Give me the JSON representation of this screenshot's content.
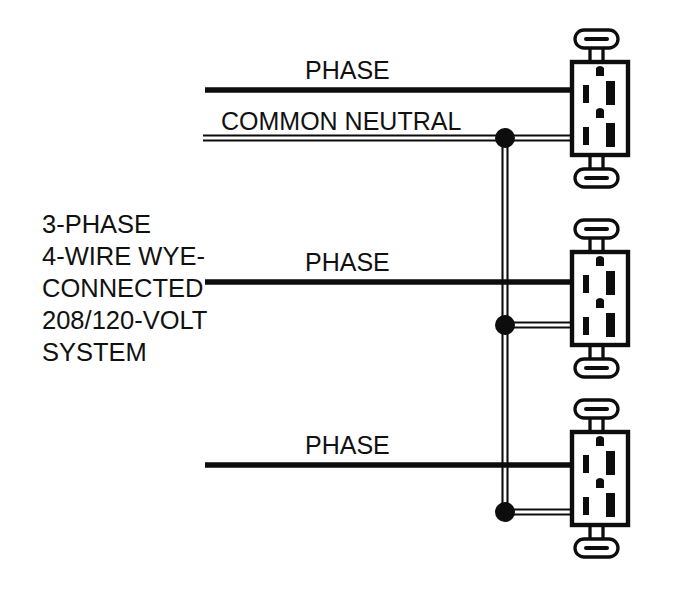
{
  "diagram": {
    "canvas": {
      "width": 677,
      "height": 590,
      "background": "#ffffff"
    },
    "ink_color": "#0d0d0d",
    "system_label": {
      "lines": [
        "3-PHASE",
        "4-WIRE WYE-",
        "CONNECTED",
        "208/120-VOLT",
        "SYSTEM"
      ],
      "x": 42,
      "line_ys": [
        233,
        265,
        297,
        329,
        361
      ]
    },
    "wire_labels": [
      {
        "text": "PHASE",
        "x": 305,
        "y": 79
      },
      {
        "text": "COMMON NEUTRAL",
        "x": 221,
        "y": 130
      },
      {
        "text": "PHASE",
        "x": 305,
        "y": 271
      },
      {
        "text": "PHASE",
        "x": 305,
        "y": 454
      }
    ],
    "phase_wires": [
      {
        "name": "phase-a",
        "x1": 205,
        "y": 90,
        "x2": 574
      },
      {
        "name": "phase-b",
        "x1": 205,
        "y": 282,
        "x2": 574
      },
      {
        "name": "phase-c",
        "x1": 205,
        "y": 465,
        "x2": 574
      }
    ],
    "neutral": {
      "name": "common-neutral",
      "style": "double-line",
      "gap": 5,
      "horizontal_runs": [
        {
          "name": "neutral-main-run",
          "x1": 203,
          "y": 138,
          "x2": 574
        },
        {
          "name": "neutral-branch-middle",
          "x1": 505,
          "y": 325,
          "x2": 574
        },
        {
          "name": "neutral-branch-bottom",
          "x1": 505,
          "y": 512,
          "x2": 574
        }
      ],
      "vertical_run": {
        "name": "neutral-trunk",
        "x": 505,
        "y1": 138,
        "y2": 512
      }
    },
    "junction_dots": [
      {
        "name": "junction-top",
        "cx": 505,
        "cy": 138,
        "r": 10
      },
      {
        "name": "junction-middle",
        "cx": 505,
        "cy": 325,
        "r": 10
      },
      {
        "name": "junction-bottom",
        "cx": 505,
        "cy": 512,
        "r": 10
      }
    ],
    "receptacles": [
      {
        "name": "receptacle-top",
        "x": 572,
        "y": 62,
        "width": 56,
        "height": 93
      },
      {
        "name": "receptacle-middle",
        "x": 572,
        "y": 252,
        "width": 56,
        "height": 93
      },
      {
        "name": "receptacle-bottom",
        "x": 572,
        "y": 432,
        "width": 56,
        "height": 93
      }
    ],
    "receptacle_detail": {
      "type": "duplex-receptacle",
      "outlets_per_device": 2,
      "features": [
        "ground-hole",
        "narrow-slot",
        "wide-slot",
        "mounting-strap"
      ]
    }
  }
}
